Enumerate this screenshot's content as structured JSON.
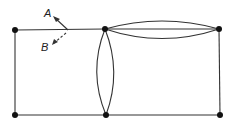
{
  "diagram": {
    "type": "graph",
    "colors": {
      "stroke": "#333333",
      "node": "#111111",
      "background": "#ffffff"
    },
    "nodes": [
      {
        "id": "n1",
        "x": 15,
        "y": 30
      },
      {
        "id": "n2",
        "x": 105,
        "y": 29
      },
      {
        "id": "n3",
        "x": 219,
        "y": 29
      },
      {
        "id": "n4",
        "x": 15,
        "y": 115
      },
      {
        "id": "n5",
        "x": 106,
        "y": 115
      },
      {
        "id": "n6",
        "x": 219,
        "y": 115
      }
    ],
    "edges": [
      {
        "from": "n1",
        "to": "n2",
        "style": "straight"
      },
      {
        "from": "n2",
        "to": "n3",
        "style": "straight"
      },
      {
        "from": "n2",
        "to": "n3",
        "style": "arc-up"
      },
      {
        "from": "n2",
        "to": "n3",
        "style": "arc-down"
      },
      {
        "from": "n1",
        "to": "n4",
        "style": "straight"
      },
      {
        "from": "n3",
        "to": "n6",
        "style": "straight"
      },
      {
        "from": "n4",
        "to": "n5",
        "style": "straight"
      },
      {
        "from": "n5",
        "to": "n6",
        "style": "straight"
      },
      {
        "from": "n2",
        "to": "n5",
        "style": "arc-left"
      },
      {
        "from": "n2",
        "to": "n5",
        "style": "arc-right"
      }
    ],
    "arrows": [
      {
        "label": "A",
        "style": "solid",
        "direction": "up-left"
      },
      {
        "label": "B",
        "style": "dashed",
        "direction": "down-left"
      }
    ]
  }
}
